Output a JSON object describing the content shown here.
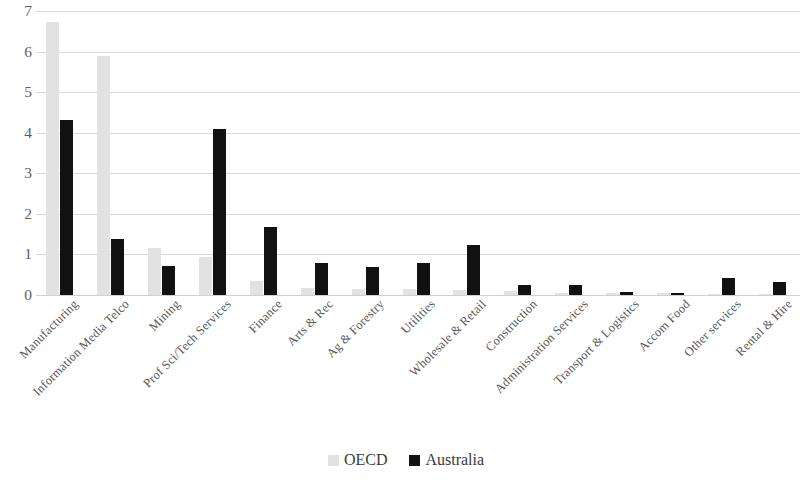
{
  "chart_data": {
    "type": "bar",
    "title": "",
    "xlabel": "",
    "ylabel": "",
    "ylim": [
      0,
      7
    ],
    "yticks": [
      0,
      1,
      2,
      3,
      4,
      5,
      6,
      7
    ],
    "grid": true,
    "legend_position": "bottom",
    "categories": [
      "Manufacturing",
      "Information Media Telco",
      "Mining",
      "Prof Sci/Tech Services",
      "Finance",
      "Arts & Rec",
      "Ag & Forestry",
      "Utilities",
      "Wholesale & Retail",
      "Construction",
      "Administration Services",
      "Transport & Logistics",
      "Accom Food",
      "Other services",
      "Rental & Hire"
    ],
    "series": [
      {
        "name": "OECD",
        "color": "#e2e2e2",
        "values": [
          6.72,
          5.88,
          1.15,
          0.93,
          0.35,
          0.18,
          0.15,
          0.15,
          0.13,
          0.1,
          0.06,
          0.05,
          0.05,
          0.03,
          0.02
        ]
      },
      {
        "name": "Australia",
        "color": "#111111",
        "values": [
          4.31,
          1.38,
          0.72,
          4.1,
          1.68,
          0.79,
          0.68,
          0.78,
          1.23,
          0.25,
          0.24,
          0.08,
          0.06,
          0.43,
          0.32
        ]
      }
    ]
  },
  "legend": {
    "items": [
      {
        "label": "OECD",
        "swatch": "oecd"
      },
      {
        "label": "Australia",
        "swatch": "aus"
      }
    ]
  }
}
